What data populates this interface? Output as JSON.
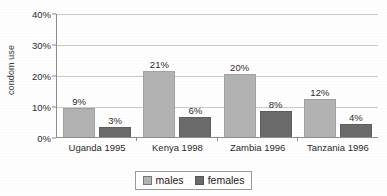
{
  "chart_data": {
    "type": "bar",
    "title": "",
    "xlabel": "",
    "ylabel": "condom use",
    "categories": [
      "Uganda 1995",
      "Kenya 1998",
      "Zambia 1996",
      "Tanzania 1996"
    ],
    "series": [
      {
        "name": "males",
        "color": "#b3b3b3",
        "values": [
          9,
          21,
          20,
          12
        ],
        "labels": [
          "9%",
          "21%",
          "20%",
          "12%"
        ]
      },
      {
        "name": "females",
        "color": "#6b6b6b",
        "values": [
          3,
          6,
          8,
          4
        ],
        "labels": [
          "3%",
          "6%",
          "8%",
          "4%"
        ]
      }
    ],
    "ylim": [
      0,
      40
    ],
    "yticks": [
      0,
      10,
      20,
      30,
      40
    ],
    "ytick_labels": [
      "0%",
      "10%",
      "20%",
      "30%",
      "40%"
    ],
    "grid": true,
    "legend_position": "bottom",
    "value_labels": true,
    "units": "percent"
  },
  "legend": {
    "males_label": "males",
    "females_label": "females"
  }
}
